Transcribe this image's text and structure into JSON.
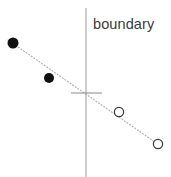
{
  "figure": {
    "title": "",
    "width": 171,
    "height": 177,
    "background_color": "#ffffff",
    "label": "boundary",
    "label_color": "#3b3b3b",
    "boundary_line_color": "#9a9a9a",
    "trend_line_color": "#b0b0b0",
    "filled_marker_color": "#111111",
    "open_marker_stroke": "#3a3a3a",
    "open_marker_fill": "#ffffff",
    "tick_color": "#8a8a8a"
  },
  "chart_data": {
    "type": "scatter",
    "title": "",
    "xlabel": "",
    "ylabel": "",
    "xlim": [
      0,
      171
    ],
    "ylim": [
      0,
      177
    ],
    "grid": false,
    "legend": null,
    "annotations": [
      {
        "name": "boundary",
        "text": "boundary",
        "x": 93,
        "y": 29
      }
    ],
    "lines": [
      {
        "name": "boundary-line",
        "style": "solid",
        "color": "#9a9a9a",
        "x1": 86,
        "y1": 8,
        "x2": 86,
        "y2": 177
      },
      {
        "name": "trend-line",
        "style": "dotted",
        "color": "#b0b0b0",
        "x1": 8,
        "y1": 40,
        "x2": 162,
        "y2": 147
      },
      {
        "name": "origin-tick",
        "style": "solid",
        "color": "#8a8a8a",
        "x1": 71,
        "y1": 93,
        "x2": 102,
        "y2": 93
      }
    ],
    "series": [
      {
        "name": "filled-points",
        "marker": "filled-circle",
        "color": "#111111",
        "points": [
          {
            "x": 13,
            "y": 43,
            "r": 5.5
          },
          {
            "x": 49,
            "y": 78,
            "r": 5.0
          }
        ]
      },
      {
        "name": "open-points",
        "marker": "open-circle",
        "color": "#3a3a3a",
        "points": [
          {
            "x": 119,
            "y": 112,
            "r": 4.6
          },
          {
            "x": 158,
            "y": 144,
            "r": 4.6
          }
        ]
      }
    ]
  }
}
